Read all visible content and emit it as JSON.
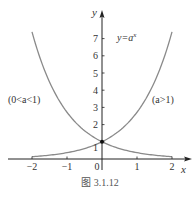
{
  "chart_data": {
    "type": "line",
    "title": "",
    "xlabel": "x",
    "ylabel": "y",
    "xlim": [
      -2,
      2
    ],
    "ylim": [
      0,
      8
    ],
    "grid": false,
    "x_ticks": [
      -2,
      -1,
      0,
      1,
      2
    ],
    "x_tick_labels": [
      "−2",
      "−1",
      "0",
      "1",
      "2"
    ],
    "y_ticks": [
      1,
      2,
      3,
      4,
      5,
      6,
      7
    ],
    "y_tick_labels": [
      "1",
      "2",
      "3",
      "4",
      "5",
      "6",
      "7"
    ],
    "series": [
      {
        "name": "(0<a<1)",
        "formula": "y = a^x, 0<a<1",
        "x": [
          -2,
          -1.5,
          -1,
          -0.5,
          0,
          0.5,
          1,
          1.5,
          2
        ],
        "values": [
          7.39,
          4.48,
          2.72,
          1.65,
          1,
          0.61,
          0.37,
          0.22,
          0.14
        ]
      },
      {
        "name": "(a>1)",
        "formula": "y = a^x, a>1",
        "x": [
          -2,
          -1.5,
          -1,
          -0.5,
          0,
          0.5,
          1,
          1.5,
          2
        ],
        "values": [
          0.14,
          0.22,
          0.37,
          0.61,
          1,
          1.65,
          2.72,
          4.48,
          7.39
        ]
      }
    ],
    "annotations": [
      {
        "text": "y=a^x",
        "x": 0.8,
        "y": 7
      },
      {
        "text": "(0<a<1)",
        "x": -1.8,
        "y": 3.4
      },
      {
        "text": "(a>1)",
        "x": 1.6,
        "y": 3.4
      }
    ],
    "points": [
      {
        "x": 0,
        "y": 1
      }
    ],
    "caption": "图 3.1.12"
  },
  "labels": {
    "x_axis": "x",
    "y_axis": "y",
    "curve_label": "y=a",
    "curve_label_exp": "x",
    "left_label": "(0<a<1)",
    "right_label": "(a>1)",
    "caption": "图 3.1.12"
  },
  "colors": {
    "axis": "#222222",
    "curve": "#8a8a8a",
    "point": "#111111"
  }
}
